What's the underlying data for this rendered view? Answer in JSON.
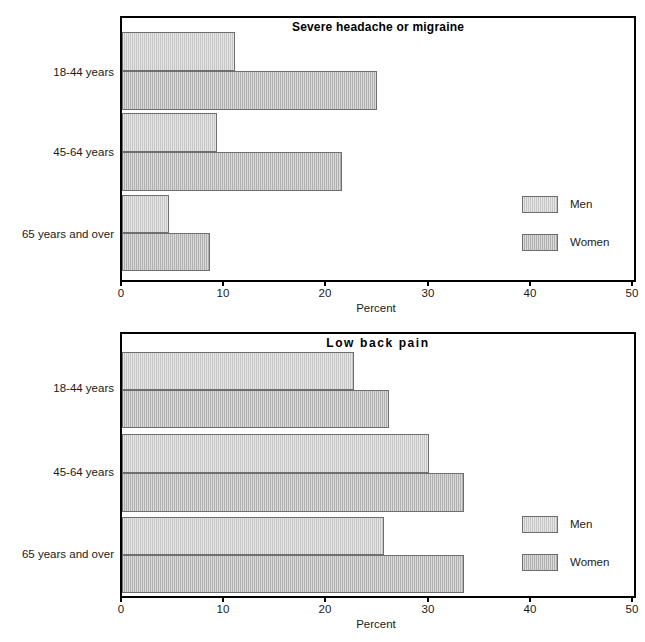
{
  "figure": {
    "clipped_caption": "Percent of adults reporting pain by age group"
  },
  "axis": {
    "ticks": [
      0,
      10,
      20,
      30,
      40,
      50
    ],
    "tick_labels": [
      "0",
      "10",
      "20",
      "30",
      "40",
      "50"
    ],
    "title": "Percent",
    "min": 0,
    "max": 50
  },
  "legend": {
    "items": [
      {
        "label": "Men",
        "color": "#c6c6c6"
      },
      {
        "label": "Women",
        "color": "#b0b0b0"
      }
    ]
  },
  "charts": [
    {
      "id": "headache",
      "title": "Severe headache or migraine",
      "categories": [
        "18-44 years",
        "45-64 years",
        "65 years and over"
      ],
      "series": [
        {
          "name": "Men",
          "values": [
            11.0,
            9.3,
            4.6
          ]
        },
        {
          "name": "Women",
          "values": [
            24.9,
            21.5,
            8.6
          ]
        }
      ]
    },
    {
      "id": "backpain",
      "title": "Low  back  pain",
      "categories": [
        "18-44 years",
        "45-64 years",
        "65 years and over"
      ],
      "series": [
        {
          "name": "Men",
          "values": [
            22.7,
            30.0,
            25.6
          ]
        },
        {
          "name": "Women",
          "values": [
            26.1,
            33.4,
            33.4
          ]
        }
      ]
    }
  ],
  "chart_data": [
    {
      "type": "bar",
      "orientation": "horizontal",
      "title": "Severe headache or migraine",
      "categories": [
        "18-44 years",
        "45-64 years",
        "65 years and over"
      ],
      "series": [
        {
          "name": "Men",
          "values": [
            11.0,
            9.3,
            4.6
          ]
        },
        {
          "name": "Women",
          "values": [
            24.9,
            21.5,
            8.6
          ]
        }
      ],
      "xlabel": "Percent",
      "ylabel": "",
      "xlim": [
        0,
        50
      ],
      "xticks": [
        0,
        10,
        20,
        30,
        40,
        50
      ],
      "grid": false,
      "legend": [
        "Men",
        "Women"
      ],
      "legend_position": "right-middle"
    },
    {
      "type": "bar",
      "orientation": "horizontal",
      "title": "Low  back  pain",
      "categories": [
        "18-44 years",
        "45-64 years",
        "65 years and over"
      ],
      "series": [
        {
          "name": "Men",
          "values": [
            22.7,
            30.0,
            25.6
          ]
        },
        {
          "name": "Women",
          "values": [
            26.1,
            33.4,
            33.4
          ]
        }
      ],
      "xlabel": "Percent",
      "ylabel": "",
      "xlim": [
        0,
        50
      ],
      "xticks": [
        0,
        10,
        20,
        30,
        40,
        50
      ],
      "grid": false,
      "legend": [
        "Men",
        "Women"
      ],
      "legend_position": "right-bottom"
    }
  ]
}
